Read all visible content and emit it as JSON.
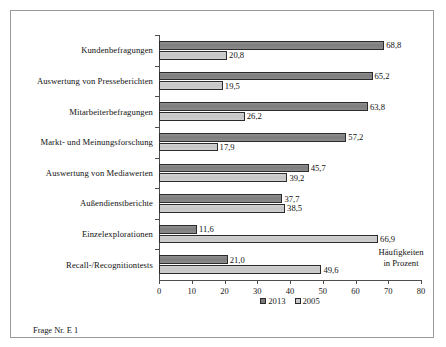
{
  "figure": {
    "footer_note": "Frage Nr. E 1",
    "axis_annotation_line1": "Häufigkeiten",
    "axis_annotation_line2": "in Prozent"
  },
  "chart_data": {
    "type": "bar",
    "orientation": "horizontal",
    "title": "",
    "subtitle": "",
    "xlabel": "Häufigkeiten in Prozent",
    "ylabel": "",
    "xlim": [
      0,
      80
    ],
    "xticks": [
      0,
      10,
      20,
      30,
      40,
      50,
      60,
      70,
      80
    ],
    "xticklabels": [
      "0",
      "10",
      "20",
      "30",
      "40",
      "50",
      "60",
      "70",
      "80"
    ],
    "grid": false,
    "legend_position": "bottom-center",
    "categories": [
      "Kundenbefragungen",
      "Auswertung von Presseberichten",
      "Mitarbeiterbefragungen",
      "Markt- und Meinungsforschung",
      "Auswertung von Mediawerten",
      "Außendienstberichte",
      "Einzelexplorationen",
      "Recall-/Recognitiontests"
    ],
    "series": [
      {
        "name": "2013",
        "color": "#7d7d7d",
        "values": [
          68.8,
          65.2,
          63.8,
          57.2,
          45.7,
          37.7,
          11.6,
          21.0
        ],
        "labels": [
          "68,8",
          "65,2",
          "63,8",
          "57,2",
          "45,7",
          "37,7",
          "11,6",
          "21,0"
        ]
      },
      {
        "name": "2005",
        "color": "#c9c9c9",
        "values": [
          20.8,
          19.5,
          26.2,
          17.9,
          39.2,
          38.5,
          66.9,
          49.6
        ],
        "labels": [
          "20,8",
          "19,5",
          "26,2",
          "17,9",
          "39,2",
          "38,5",
          "66,9",
          "49,6"
        ]
      }
    ]
  }
}
